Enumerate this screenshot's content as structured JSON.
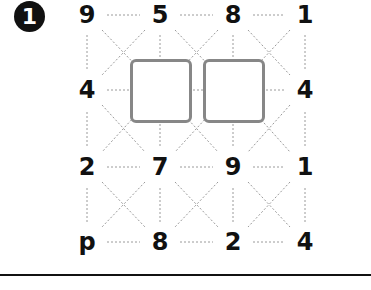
{
  "problem": {
    "number": "1",
    "grid": [
      [
        "9",
        "5",
        "8",
        "1"
      ],
      [
        "4",
        "",
        "",
        "4"
      ],
      [
        "2",
        "7",
        "9",
        "1"
      ],
      [
        "p",
        "8",
        "2",
        "4"
      ]
    ],
    "blank_boxes": [
      {
        "row": 1,
        "col": 1
      },
      {
        "row": 1,
        "col": 2
      }
    ]
  },
  "colors": {
    "text": "#111111",
    "box_border": "#878787",
    "dotted_line": "#9a9a9a",
    "rule": "#111111"
  }
}
